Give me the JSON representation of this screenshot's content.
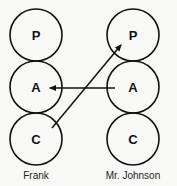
{
  "diagram": {
    "type": "transactional-analysis",
    "people": [
      {
        "name": "Frank",
        "states": [
          "P",
          "A",
          "C"
        ]
      },
      {
        "name": "Mr. Johnson",
        "states": [
          "P",
          "A",
          "C"
        ]
      }
    ],
    "arrows": [
      {
        "from": "Mr. Johnson.A",
        "to": "Frank.A"
      },
      {
        "from": "Frank.C",
        "to": "Mr. Johnson.P"
      }
    ]
  },
  "labels": {
    "left_name": "Frank",
    "right_name": "Mr. Johnson",
    "left_p": "P",
    "left_a": "A",
    "left_c": "C",
    "right_p": "P",
    "right_a": "A",
    "right_c": "C"
  }
}
